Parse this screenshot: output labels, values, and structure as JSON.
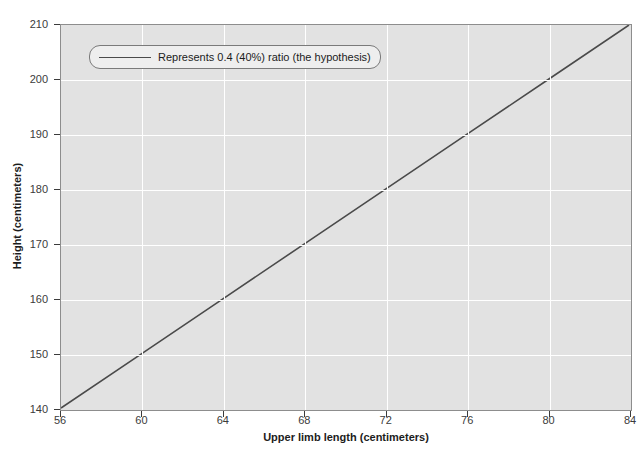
{
  "chart_data": {
    "type": "line",
    "title": "",
    "subtitle": "",
    "xlabel": "Upper limb length (centimeters)",
    "ylabel": "Height (centimeters)",
    "xlim": [
      56,
      84
    ],
    "ylim": [
      140,
      210
    ],
    "xticks": [
      56,
      60,
      64,
      68,
      72,
      76,
      80,
      84
    ],
    "yticks": [
      140,
      150,
      160,
      170,
      180,
      190,
      200,
      210
    ],
    "grid": true,
    "legend_position": "upper left",
    "series": [
      {
        "name": "Represents 0.4 (40%) ratio (the hypothesis)",
        "color": "#4a4a4a",
        "x": [
          56,
          60,
          64,
          68,
          72,
          76,
          80,
          84
        ],
        "values": [
          140,
          150,
          160,
          170,
          180,
          190,
          200,
          210
        ]
      }
    ],
    "annotations": []
  },
  "axes": {
    "x_title": "Upper limb length (centimeters)",
    "y_title": "Height (centimeters)",
    "x_tick_labels": [
      "56",
      "60",
      "64",
      "68",
      "72",
      "76",
      "80",
      "84"
    ],
    "y_tick_labels": [
      "140",
      "150",
      "160",
      "170",
      "180",
      "190",
      "200",
      "210"
    ]
  },
  "legend": {
    "entries": [
      {
        "label": "Represents 0.4 (40%) ratio (the hypothesis)",
        "swatch": "line-swatch"
      }
    ]
  },
  "colors": {
    "plot_background": "#e2e2e2",
    "page_background": "#ffffff",
    "gridline": "#ffffff",
    "series_line": "#4a4a4a",
    "axis_border": "#8d8d8d",
    "tick_label": "#3b3b3b",
    "axis_title": "#1c1c1c",
    "legend_background": "#eeeeee",
    "legend_border": "#7a7a7a"
  },
  "watermark": {
    "top_mark": "",
    "body_mark": ""
  }
}
